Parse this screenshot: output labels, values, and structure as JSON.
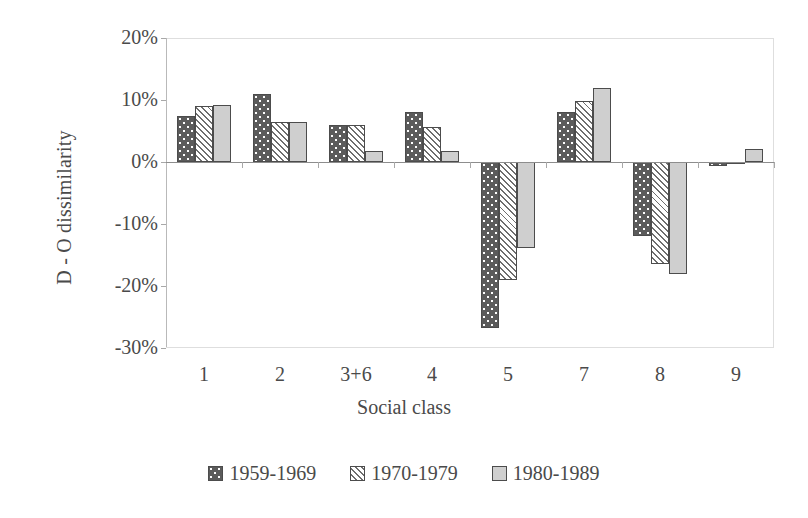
{
  "chart_data": {
    "type": "bar",
    "title": "",
    "xlabel": "Social class",
    "ylabel": "D - O dissimilarity",
    "categories": [
      "1",
      "2",
      "3+6",
      "4",
      "5",
      "7",
      "8",
      "9"
    ],
    "ylim": [
      -30,
      20
    ],
    "ytick_values": [
      20,
      10,
      0,
      -10,
      -20,
      -30
    ],
    "ytick_labels": [
      "20%",
      "10%",
      "0%",
      "-10%",
      "-20%",
      "-30%"
    ],
    "grid": false,
    "legend_position": "bottom",
    "value_suffix": "%",
    "series": [
      {
        "name": "1959-1969",
        "pattern": "dark-dotted",
        "values": [
          7.5,
          11.0,
          6.0,
          8.0,
          -26.7,
          8.0,
          -12.0,
          -0.6
        ]
      },
      {
        "name": "1970-1979",
        "pattern": "white-hatched",
        "values": [
          9.0,
          6.5,
          6.0,
          5.7,
          -19.0,
          9.8,
          -16.5,
          -0.2
        ]
      },
      {
        "name": "1980-1989",
        "pattern": "light-gray",
        "values": [
          9.2,
          6.5,
          1.8,
          1.8,
          -13.8,
          12.0,
          -18.0,
          2.1
        ]
      }
    ]
  },
  "axis": {
    "y_title": "D - O dissimilarity",
    "x_title": "Social class"
  }
}
